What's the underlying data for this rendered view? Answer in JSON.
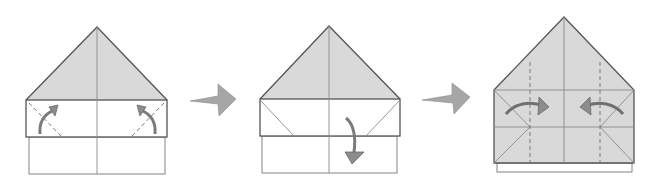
{
  "diagram": {
    "type": "origami-folding-steps",
    "step_count": 3,
    "colors": {
      "paper_colored": "#d9d9d9",
      "paper_white": "#ffffff",
      "outline": "#555555",
      "crease": "#8a8a8a",
      "arrow_fill": "#8c8c8c",
      "arrow_stroke": "#6a6a6a",
      "step_arrow": "#a6a6a6"
    },
    "steps": [
      {
        "index": 1,
        "description": "Valley-fold the two bottom corners of the front band up along dashed lines",
        "fold_arrows": [
          "curved-up-left-corner",
          "curved-up-right-corner"
        ],
        "lines": [
          "dashed-diagonal-left",
          "dashed-diagonal-right",
          "center-crease"
        ]
      },
      {
        "index": 2,
        "description": "Unfold the band down",
        "fold_arrows": [
          "curved-down"
        ],
        "lines": [
          "crease-diagonal-left",
          "crease-diagonal-right",
          "center-crease"
        ]
      },
      {
        "index": 3,
        "description": "Fold the sides in along dashed lines",
        "fold_arrows": [
          "curved-right",
          "curved-left"
        ],
        "lines": [
          "dashed-vertical-left",
          "dashed-vertical-right",
          "center-crease",
          "horizontal-crease",
          "diagonal-creases"
        ]
      }
    ],
    "transitions": [
      "step-arrow-1-to-2",
      "step-arrow-2-to-3"
    ]
  }
}
